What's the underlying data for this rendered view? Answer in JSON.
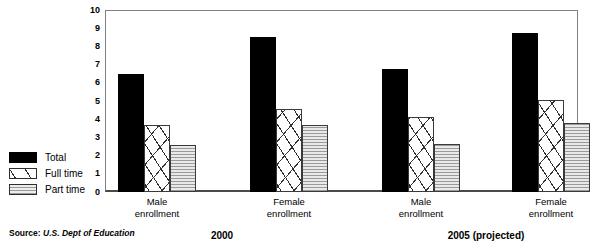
{
  "chart_data": {
    "type": "bar",
    "title": "",
    "xlabel": "",
    "ylabel": "",
    "ylim": [
      0,
      10
    ],
    "yticks": [
      "10",
      "9",
      "8",
      "7",
      "6",
      "5",
      "4",
      "3",
      "2",
      "1",
      "0"
    ],
    "grid": false,
    "legend_position": "left-outside",
    "categories": [
      "Male enrollment",
      "Female enrollment",
      "Male enrollment",
      "Female enrollment"
    ],
    "category_lines": [
      [
        "Male",
        "enrollment"
      ],
      [
        "Female",
        "enrollment"
      ],
      [
        "Male",
        "enrollment"
      ],
      [
        "Female",
        "enrollment"
      ]
    ],
    "period_groups": [
      {
        "label": "2000",
        "categories": [
          0,
          1
        ]
      },
      {
        "label": "2005 (projected)",
        "categories": [
          2,
          3
        ]
      }
    ],
    "series": [
      {
        "name": "Total",
        "values": [
          6.5,
          8.5,
          6.75,
          8.75
        ]
      },
      {
        "name": "Full time",
        "values": [
          3.7,
          4.55,
          4.1,
          5.05
        ]
      },
      {
        "name": "Part time",
        "values": [
          2.6,
          3.7,
          2.65,
          3.8
        ]
      }
    ],
    "annotations": {
      "source": "Source: U.S. Dept of Education",
      "source_prefix": "Source:",
      "source_name": "U.S. Dept of Education"
    }
  },
  "legend": {
    "items": [
      {
        "label": "Total",
        "pattern": "solid-black",
        "color": "#000000"
      },
      {
        "label": "Full time",
        "pattern": "sparse-dashes",
        "color": "#ffffff"
      },
      {
        "label": "Part time",
        "pattern": "horizontal-lines",
        "color": "#e2e2e2"
      }
    ]
  },
  "axis": {
    "y_ticks": [
      "10",
      "9",
      "8",
      "7",
      "6",
      "5",
      "4",
      "3",
      "2",
      "1",
      "0"
    ]
  },
  "periods": [
    {
      "label": "2000"
    },
    {
      "label": "2005 (projected)"
    }
  ],
  "groups": [
    {
      "line1": "Male",
      "line2": "enrollment"
    },
    {
      "line1": "Female",
      "line2": "enrollment"
    },
    {
      "line1": "Male",
      "line2": "enrollment"
    },
    {
      "line1": "Female",
      "line2": "enrollment"
    }
  ],
  "source": {
    "prefix": "Source:",
    "name": "U.S. Dept of Education"
  }
}
